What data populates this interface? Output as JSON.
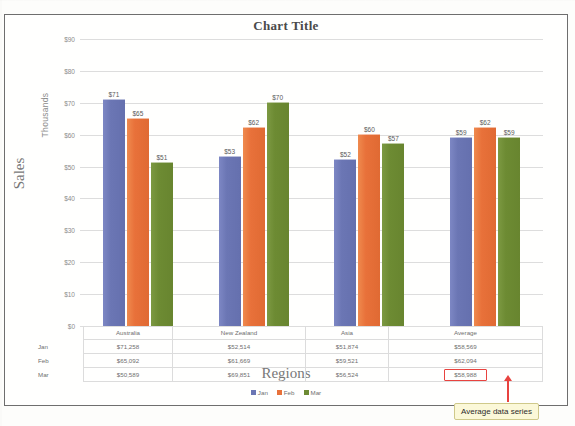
{
  "chart_data": {
    "type": "bar",
    "title": "Chart Title",
    "xlabel": "Regions",
    "ylabel": "Sales",
    "yunit": "Thousands",
    "ylim": [
      0,
      90
    ],
    "ytick_step": 10,
    "grid": true,
    "legend_position": "bottom",
    "categories": [
      "Australia",
      "New Zealand",
      "Asia",
      "Average"
    ],
    "series": [
      {
        "name": "Jan",
        "color": "#6b76b4",
        "values": [
          71258,
          52514,
          51874,
          58569
        ],
        "display_values": [
          "$71,258",
          "$52,514",
          "$51,874",
          "$58,569"
        ],
        "bar_labels": [
          "$71",
          "$53",
          "$52",
          "$59"
        ],
        "plot_values": [
          71,
          53,
          52,
          59
        ]
      },
      {
        "name": "Feb",
        "color": "#e8713a",
        "values": [
          65092,
          61669,
          59521,
          62094
        ],
        "display_values": [
          "$65,092",
          "$61,669",
          "$59,521",
          "$62,094"
        ],
        "bar_labels": [
          "$65",
          "$62",
          "$60",
          "$62"
        ],
        "plot_values": [
          65,
          62,
          60,
          62
        ]
      },
      {
        "name": "Mar",
        "color": "#6d8b33",
        "values": [
          50589,
          69851,
          56524,
          58988
        ],
        "display_values": [
          "$50,589",
          "$69,851",
          "$56,524",
          "$58,988"
        ],
        "bar_labels": [
          "$51",
          "$70",
          "$57",
          "$59"
        ],
        "plot_values": [
          51,
          70,
          57,
          59
        ]
      }
    ],
    "ytick_labels": [
      "$90",
      "$80",
      "$70",
      "$60",
      "$50",
      "$40",
      "$30",
      "$20",
      "$10",
      "$0"
    ],
    "data_table": {
      "column_headers": [
        "Australia",
        "New Zealand",
        "Asia",
        "Average"
      ],
      "row_headers": [
        "Jan",
        "Feb",
        "Mar"
      ],
      "rows": [
        [
          "$71,258",
          "$52,514",
          "$51,874",
          "$58,569"
        ],
        [
          "$65,092",
          "$61,669",
          "$59,521",
          "$62,094"
        ],
        [
          "$50,589",
          "$69,851",
          "$56,524",
          "$58,988"
        ]
      ],
      "highlighted_cell": {
        "row": 2,
        "col": 3,
        "value": "$58,988",
        "border_color": "#e8433f"
      }
    }
  },
  "annotation": {
    "callout_text": "Average data series",
    "arrow_color": "#e8433f",
    "callout_background": "#fbf8d8"
  },
  "ghost": {
    "line1": "",
    "line2": "",
    "line3": ""
  }
}
